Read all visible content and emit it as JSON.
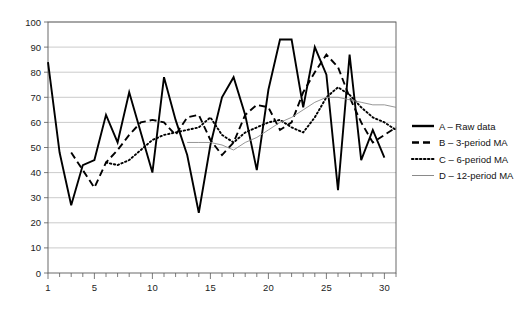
{
  "chart_data": {
    "type": "line",
    "title": "",
    "xlabel": "",
    "ylabel": "",
    "xlim": [
      1,
      31
    ],
    "ylim": [
      0,
      100
    ],
    "grid": true,
    "legend_position": "right",
    "y_ticks": [
      0,
      10,
      20,
      30,
      40,
      50,
      60,
      70,
      80,
      90,
      100
    ],
    "x_ticks": [
      1,
      5,
      10,
      15,
      20,
      25,
      30
    ],
    "x_minor_tick_step": 1,
    "x": [
      1,
      2,
      3,
      4,
      5,
      6,
      7,
      8,
      9,
      10,
      11,
      12,
      13,
      14,
      15,
      16,
      17,
      18,
      19,
      20,
      21,
      22,
      23,
      24,
      25,
      26,
      27,
      28,
      29,
      30,
      31
    ],
    "series": [
      {
        "name": "A – Raw data",
        "key": "A",
        "style": "solid-thick",
        "values": [
          84,
          48,
          27,
          43,
          45,
          63,
          52,
          72,
          56,
          40,
          78,
          61,
          47,
          24,
          51,
          70,
          78,
          63,
          41,
          73,
          93,
          93,
          66,
          90,
          79,
          33,
          87,
          45,
          57,
          46,
          null
        ]
      },
      {
        "name": "B – 3-period MA",
        "key": "B",
        "style": "dashed",
        "values": [
          null,
          null,
          48,
          41,
          34,
          44,
          49,
          55,
          60,
          61,
          60,
          55,
          62,
          63,
          53,
          47,
          52,
          63,
          67,
          66,
          57,
          60,
          72,
          80,
          87,
          82,
          70,
          60,
          52,
          55,
          58
        ]
      },
      {
        "name": "C – 6-period MA",
        "key": "C",
        "style": "dotted",
        "values": [
          null,
          null,
          null,
          null,
          null,
          44,
          43,
          45,
          49,
          53,
          55,
          56,
          57,
          58,
          62,
          55,
          52,
          56,
          58,
          60,
          61,
          58,
          56,
          62,
          70,
          74,
          71,
          66,
          62,
          60,
          57
        ]
      },
      {
        "name": "D – 12-period MA",
        "key": "D",
        "style": "solid-thin",
        "values": [
          null,
          null,
          null,
          null,
          null,
          null,
          null,
          null,
          null,
          null,
          null,
          null,
          52,
          52,
          52,
          51,
          49,
          52,
          54,
          57,
          60,
          62,
          65,
          68,
          70,
          70,
          69,
          68,
          67,
          67,
          66
        ]
      }
    ],
    "legend": [
      {
        "label": "A – Raw data",
        "style": "solid-thick"
      },
      {
        "label": "B – 3-period MA",
        "style": "dashed"
      },
      {
        "label": "C – 6-period MA",
        "style": "dotted"
      },
      {
        "label": "D – 12-period MA",
        "style": "solid-thin"
      }
    ]
  }
}
